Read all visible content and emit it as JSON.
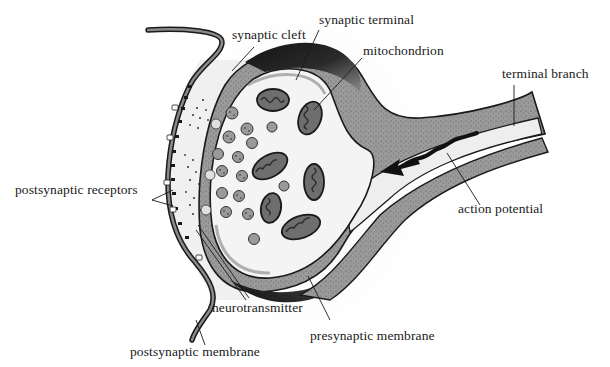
{
  "diagram": {
    "labels": {
      "synaptic_cleft": "synaptic cleft",
      "synaptic_terminal": "synaptic terminal",
      "mitochondrion": "mitochondrion",
      "terminal_branch": "terminal branch",
      "postsynaptic_receptors": "postsynaptic receptors",
      "action_potential": "action potential",
      "neurotransmitter": "neurotransmitter",
      "presynaptic_membrane": "presynaptic membrane",
      "postsynaptic_membrane": "postsynaptic membrane"
    },
    "colors": {
      "background": "#ffffff",
      "cytoplasm": "#f2f2f2",
      "axon_wall": "#9a9a9a",
      "terminal_dark": "#1c1c1c",
      "outline": "#1a1a1a",
      "vesicle": "#8c8c8c",
      "mitochondrion_fill": "#6e6e6e"
    }
  }
}
